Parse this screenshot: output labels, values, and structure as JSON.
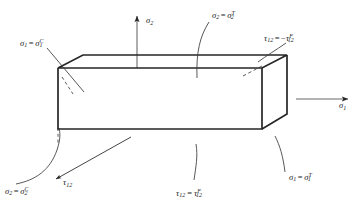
{
  "figure": {
    "line_color": "#262626",
    "text_color": "#1a1a1a",
    "background": "#ffffff"
  },
  "axes": [
    {
      "id": "sigma2-axis",
      "name": "sigma-2-axis",
      "symbol": "σ",
      "subscript": "2",
      "direction": "up"
    },
    {
      "id": "sigma1-axis",
      "name": "sigma-1-axis",
      "symbol": "σ",
      "subscript": "1",
      "direction": "right"
    }
  ],
  "labels": {
    "sigma1_compressive": {
      "lhs_symbol": "σ",
      "lhs_sub": "1",
      "equals": "=",
      "rhs_symbol": "σ",
      "rhs_sub": "1",
      "rhs_sup": "C",
      "meaning": "compressive strength along fiber direction 1"
    },
    "sigma2_tensile": {
      "lhs_symbol": "σ",
      "lhs_sub": "2",
      "equals": "=",
      "rhs_symbol": "σ",
      "rhs_sub": "2",
      "rhs_sup": "T",
      "meaning": "tensile strength transverse direction 2"
    },
    "tau12_negative": {
      "lhs_symbol": "τ",
      "lhs_sub": "12",
      "equals": "=",
      "minus": "−",
      "rhs_symbol": "τ",
      "rhs_sub": "12",
      "rhs_sup": "F",
      "meaning": "negative shear strength"
    },
    "sigma1_tensile": {
      "lhs_symbol": "σ",
      "lhs_sub": "1",
      "equals": "=",
      "rhs_symbol": "σ",
      "rhs_sub": "1",
      "rhs_sup": "T",
      "meaning": "tensile strength along fiber direction 1"
    },
    "tau12_positive": {
      "lhs_symbol": "τ",
      "lhs_sub": "12",
      "equals": "=",
      "rhs_symbol": "τ",
      "rhs_sub": "12",
      "rhs_sup": "F",
      "meaning": "positive shear strength"
    },
    "sigma2_compressive": {
      "lhs_symbol": "σ",
      "lhs_sub": "2",
      "equals": "=",
      "rhs_symbol": "σ",
      "rhs_sub": "2",
      "rhs_sup": "C",
      "meaning": "compressive strength transverse direction 2"
    },
    "tau12_plain": {
      "lhs_symbol": "τ",
      "lhs_sub": "12",
      "meaning": "in-plane shear stress"
    }
  }
}
